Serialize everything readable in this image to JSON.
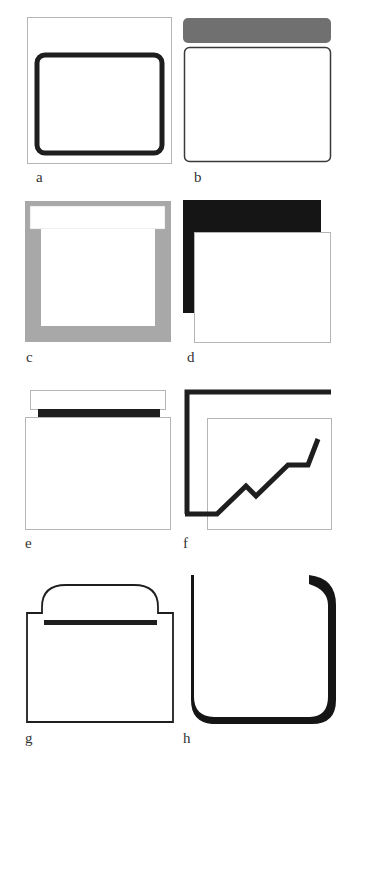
{
  "figure": {
    "panels": [
      {
        "id": "a",
        "label": "a",
        "description": "window with thick rounded border inside thin frame"
      },
      {
        "id": "b",
        "label": "b",
        "description": "window with separate gray title bar"
      },
      {
        "id": "c",
        "label": "c",
        "description": "white window on gray backdrop with white title strip"
      },
      {
        "id": "d",
        "label": "d",
        "description": "white window offset over black shadow block"
      },
      {
        "id": "e",
        "label": "e",
        "description": "window with white header and black underline bar"
      },
      {
        "id": "f",
        "label": "f",
        "description": "L-shaped frame with rising line graph over window"
      },
      {
        "id": "g",
        "label": "g",
        "description": "folder-like window with rounded tab and black bar"
      },
      {
        "id": "h",
        "label": "h",
        "description": "open bracket shape with tapering stroke"
      }
    ]
  },
  "colors": {
    "background": "#ffffff",
    "thin_frame": "#b5b5b5",
    "dark_stroke": "#1e1e1e",
    "gray_bar": "#707070",
    "gray_backdrop": "#a8a8a8",
    "black_block": "#151515"
  }
}
